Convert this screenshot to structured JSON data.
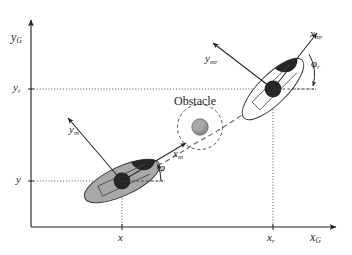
{
  "figure": {
    "kind": "coordinate-frame-diagram",
    "caption_absent": true,
    "background_color": "#ffffff",
    "line_color": "#252525",
    "robot_body_fill": "#a8a8a8",
    "robot_head_fill": "#262626",
    "obstacle_fill": "#9a9a9a",
    "dashed_color": "#6f6f6f"
  },
  "axes": {
    "y_axis_label": "y",
    "y_axis_sub": "G",
    "x_axis_label": "x",
    "x_axis_sub": "G",
    "ticks": [
      {
        "name": "y-tick-r",
        "label": "y",
        "sub": "r"
      },
      {
        "name": "y-tick-current",
        "label": "y",
        "sub": ""
      },
      {
        "name": "x-tick-current",
        "label": "x",
        "sub": ""
      },
      {
        "name": "x-tick-r",
        "label": "x",
        "sub": "r"
      }
    ]
  },
  "robot_current": {
    "name": "mobile-robot-current-pose",
    "local_x_label": "x",
    "local_x_sub": "m",
    "local_y_label": "y",
    "local_y_sub": "m",
    "heading_angle_label": "φ",
    "heading_angle_sub": "",
    "position_x_tick": "x",
    "position_y_tick": "y",
    "heading_deg": 25
  },
  "robot_reference": {
    "name": "mobile-robot-reference-pose",
    "local_x_label": "x",
    "local_x_sub": "mr",
    "local_y_label": "y",
    "local_y_sub": "mr",
    "heading_angle_label": "φ",
    "heading_angle_sub": "r",
    "position_x_tick": "x",
    "position_y_tick": "y",
    "heading_deg": 45
  },
  "obstacle": {
    "name": "obstacle",
    "label": "Obstacle",
    "has_safety_circle": true
  },
  "path": {
    "name": "planned-path",
    "style": "dashed"
  }
}
